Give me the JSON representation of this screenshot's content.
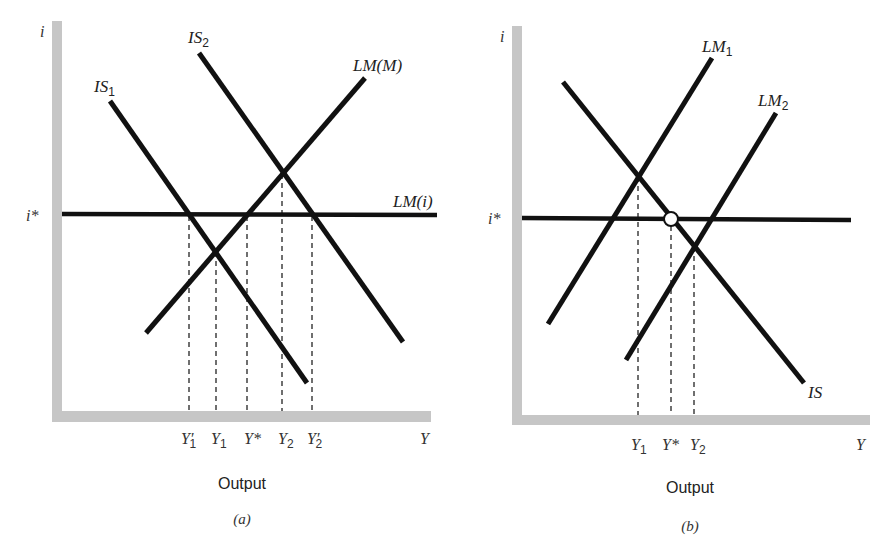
{
  "colors": {
    "curve": "#111111",
    "axis": "#c6c6c6",
    "dash": "#333333",
    "background": "#ffffff"
  },
  "panel_a": {
    "y_axis_label": "i",
    "x_axis_label": "Y",
    "i_star_label": "i*",
    "curves": {
      "is1": {
        "main": "IS",
        "sub": "1"
      },
      "is2": {
        "main": "IS",
        "sub": "2"
      },
      "lm_m": {
        "label": "LM(M)"
      },
      "lm_i": {
        "label": "LM(i)"
      }
    },
    "x_markers": [
      {
        "main": "Y′",
        "sub": "1"
      },
      {
        "main": "Y",
        "sub": "1"
      },
      {
        "main": "Y*",
        "sub": ""
      },
      {
        "main": "Y",
        "sub": "2"
      },
      {
        "main": "Y′",
        "sub": "2"
      }
    ],
    "axis_title": "Output",
    "caption": "(a)"
  },
  "panel_b": {
    "y_axis_label": "i",
    "x_axis_label": "Y",
    "i_star_label": "i*",
    "curves": {
      "lm1": {
        "main": "LM",
        "sub": "1"
      },
      "lm2": {
        "main": "LM",
        "sub": "2"
      },
      "is": {
        "label": "IS"
      }
    },
    "x_markers": [
      {
        "main": "Y",
        "sub": "1"
      },
      {
        "main": "Y*",
        "sub": ""
      },
      {
        "main": "Y",
        "sub": "2"
      }
    ],
    "axis_title": "Output",
    "caption": "(b)"
  }
}
